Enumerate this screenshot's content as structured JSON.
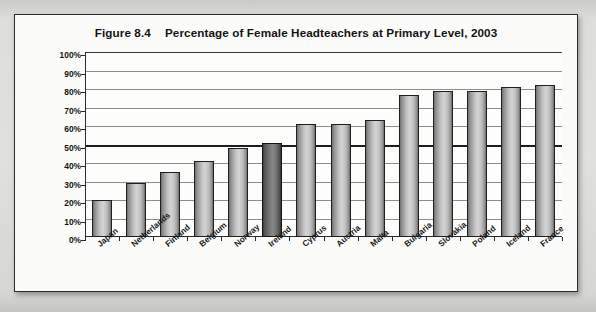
{
  "figure": {
    "number": "Figure 8.4",
    "title": "Percentage of Female Headteachers at Primary Level, 2003"
  },
  "chart_data": {
    "type": "bar",
    "title": "Percentage of Female Headteachers at Primary Level, 2003",
    "xlabel": "",
    "ylabel": "",
    "ylim": [
      0,
      100
    ],
    "ytick_labels": [
      "100%",
      "90%",
      "80%",
      "70%",
      "60%",
      "50%",
      "40%",
      "30%",
      "20%",
      "10%",
      "0%"
    ],
    "ytick_values": [
      100,
      90,
      80,
      70,
      60,
      50,
      40,
      30,
      20,
      10,
      0
    ],
    "grid": true,
    "legend": "none",
    "emphasis_line": 50,
    "highlight_category": "Ireland",
    "categories": [
      "Japan",
      "Netherlands",
      "Finland",
      "Belgium",
      "Norway",
      "Ireland",
      "Cyprus",
      "Austria",
      "Malta",
      "Bulgaria",
      "Slovakia",
      "Poland",
      "Iceland",
      "France"
    ],
    "values": [
      20,
      29,
      35,
      41,
      48,
      51,
      61,
      61,
      63,
      77,
      79,
      79,
      81,
      82
    ],
    "colors": {
      "bar_fill": "#c9c9c9",
      "bar_highlight": "#6f6f6f",
      "bar_outline": "#1f1f1f",
      "gridline": "#8e8e8e",
      "emphasis_line": "#1d1d1d",
      "axis": "#2a2a2a",
      "card_background": "#fbfbfa",
      "page_background": "#d8d8d6"
    }
  }
}
